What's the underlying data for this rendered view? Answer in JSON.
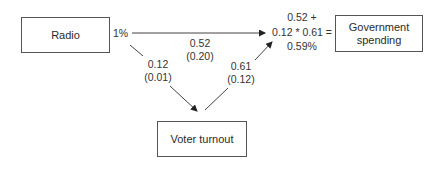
{
  "nodes": {
    "radio": "Radio",
    "government_spending": "Government spending",
    "voter_turnout": "Voter turnout"
  },
  "edges": {
    "radio_effect": "1%",
    "direct": {
      "coef": "0.52",
      "se": "(0.20)"
    },
    "radio_to_turnout": {
      "coef": "0.12",
      "se": "(0.01)"
    },
    "turnout_to_spending": {
      "coef": "0.61",
      "se": "(0.12)"
    }
  },
  "total_effect": {
    "line1": "0.52 +",
    "line2": "0.12 * 0.61 =",
    "line3": "0.59%"
  }
}
